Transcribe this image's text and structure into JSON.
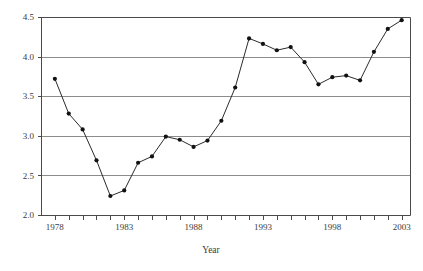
{
  "chart_data": {
    "type": "line",
    "title": "",
    "xlabel": "Year",
    "ylabel": "",
    "xlim": [
      1977,
      2003.6
    ],
    "ylim": [
      2.0,
      4.5
    ],
    "grid": true,
    "grid_axis": "y",
    "legend": false,
    "legend_position": "none",
    "marker": "filled-circle",
    "x": [
      1978,
      1979,
      1980,
      1981,
      1982,
      1983,
      1984,
      1985,
      1986,
      1987,
      1988,
      1989,
      1990,
      1991,
      1992,
      1993,
      1994,
      1995,
      1996,
      1997,
      1998,
      1999,
      2000,
      2001,
      2002,
      2003
    ],
    "values": [
      3.72,
      3.28,
      3.08,
      2.69,
      2.24,
      2.31,
      2.66,
      2.74,
      2.99,
      2.95,
      2.86,
      2.94,
      3.19,
      3.61,
      4.23,
      4.16,
      4.08,
      4.12,
      3.93,
      3.65,
      3.74,
      3.76,
      3.7,
      4.06,
      4.35,
      4.46
    ],
    "series": [
      {
        "name": "value",
        "values": [
          3.72,
          3.28,
          3.08,
          2.69,
          2.24,
          2.31,
          2.66,
          2.74,
          2.99,
          2.95,
          2.86,
          2.94,
          3.19,
          3.61,
          4.23,
          4.16,
          4.08,
          4.12,
          3.93,
          3.65,
          3.74,
          3.76,
          3.7,
          4.06,
          4.35,
          4.46
        ]
      }
    ],
    "y_ticks": [
      2.0,
      2.5,
      3.0,
      3.5,
      4.0,
      4.5
    ],
    "y_tick_labels": [
      "2.0",
      "2.5",
      "3.0",
      "3.5",
      "4.0",
      "4.5"
    ],
    "x_ticks": [
      1978,
      1979,
      1980,
      1981,
      1982,
      1983,
      1984,
      1985,
      1986,
      1987,
      1988,
      1989,
      1990,
      1991,
      1992,
      1993,
      1994,
      1995,
      1996,
      1997,
      1998,
      1999,
      2000,
      2001,
      2002,
      2003
    ],
    "x_tick_labels": [
      {
        "value": 1978,
        "label": "1978"
      },
      {
        "value": 1983,
        "label": "1983"
      },
      {
        "value": 1988,
        "label": "1988"
      },
      {
        "value": 1993,
        "label": "1993"
      },
      {
        "value": 1998,
        "label": "1998"
      },
      {
        "value": 2003,
        "label": "2003"
      }
    ],
    "colors": {
      "line": "#2b2b2b",
      "marker": "#111111",
      "grid": "#8c8c8c",
      "axis": "#4a4a4a",
      "background": "#ffffff",
      "text": "#3b3b3b"
    }
  }
}
